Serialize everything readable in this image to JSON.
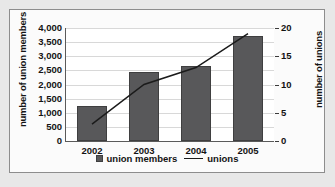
{
  "chart_data": {
    "type": "bar",
    "title": "",
    "subtitle": "",
    "xlabel": "",
    "ylabel": "number of union members",
    "y2label": "number of unions",
    "categories": [
      "2002",
      "2003",
      "2004",
      "2005"
    ],
    "grid": true,
    "legend_position": "bottom",
    "series": [
      {
        "name": "union members",
        "type": "bar",
        "axis": "left",
        "color": "#58585a",
        "values": [
          1250,
          2450,
          2650,
          3700
        ]
      },
      {
        "name": "unions",
        "type": "line",
        "axis": "right",
        "color": "#1b1b1b",
        "values": [
          3,
          10,
          13,
          19
        ]
      }
    ],
    "yaxis_left": {
      "label": "number of union members",
      "ylim": [
        0,
        4000
      ],
      "ticks": [
        0,
        500,
        1000,
        1500,
        2000,
        2500,
        3000,
        3500,
        4000
      ],
      "tick_labels": [
        "0",
        "500",
        "1,000",
        "1,500",
        "2,000",
        "2,500",
        "3,000",
        "3,500",
        "4,000"
      ]
    },
    "yaxis_right": {
      "label": "number of unions",
      "ylim": [
        0,
        20
      ],
      "ticks": [
        0,
        5,
        10,
        15,
        20
      ],
      "tick_labels": [
        "0",
        "5",
        "10",
        "15",
        "20"
      ]
    },
    "legend": [
      {
        "label": "union members",
        "marker": "square",
        "color": "#58585a"
      },
      {
        "label": "unions",
        "marker": "line",
        "color": "#1b1b1b"
      }
    ]
  }
}
